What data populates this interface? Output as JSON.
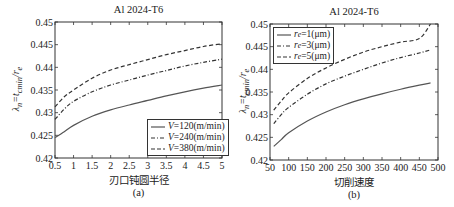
{
  "colors": {
    "axis": "#333333",
    "series_a": "#555555",
    "series_b": "#333333",
    "series_c": "#333333"
  },
  "chart_data": [
    {
      "type": "line",
      "panel": "a",
      "title": "Al 2024-T6",
      "xlabel": "刃口钝圆半径",
      "ylabel": "λn=tcmin/re",
      "caption": "(a)",
      "xlim": [
        0.5,
        5
      ],
      "ylim": [
        0.42,
        0.45
      ],
      "xticks": [
        "0.5",
        "1",
        "1.5",
        "2",
        "2.5",
        "3",
        "3.5",
        "4",
        "4.5",
        "5"
      ],
      "yticks": [
        "0.42",
        "0.425",
        "0.43",
        "0.435",
        "0.44",
        "0.445",
        "0.45"
      ],
      "legend_position": "lower right",
      "grid": false,
      "x": [
        0.5,
        0.75,
        1,
        1.5,
        2,
        2.5,
        3,
        3.5,
        4,
        4.5,
        5
      ],
      "series": [
        {
          "name": "V=120(m/min)",
          "style": "solid",
          "values": [
            0.4245,
            0.4258,
            0.4272,
            0.4292,
            0.4306,
            0.4317,
            0.4327,
            0.4337,
            0.4346,
            0.4354,
            0.4361
          ]
        },
        {
          "name": "V=240(m/min)",
          "style": "dashdot",
          "values": [
            0.4285,
            0.4308,
            0.4325,
            0.4346,
            0.4361,
            0.4372,
            0.4383,
            0.4393,
            0.4403,
            0.4411,
            0.4418
          ]
        },
        {
          "name": "V=380(m/min)",
          "style": "dashed",
          "values": [
            0.4313,
            0.4335,
            0.435,
            0.4376,
            0.4394,
            0.4406,
            0.4417,
            0.4428,
            0.4437,
            0.4446,
            0.4452
          ]
        }
      ]
    },
    {
      "type": "line",
      "panel": "b",
      "title": "Al 2024-T6",
      "xlabel": "切削速度",
      "ylabel": "λn=tcmin/re",
      "caption": "(b)",
      "xlim": [
        50,
        500
      ],
      "ylim": [
        0.42,
        0.45
      ],
      "xticks": [
        "50",
        "100",
        "150",
        "200",
        "250",
        "300",
        "350",
        "400",
        "450",
        "500"
      ],
      "yticks": [
        "0.42",
        "0.425",
        "0.43",
        "0.435",
        "0.44",
        "0.445",
        "0.45"
      ],
      "legend_position": "upper left",
      "grid": false,
      "x": [
        60,
        80,
        100,
        150,
        200,
        250,
        300,
        350,
        400,
        450,
        480
      ],
      "series": [
        {
          "name": "re=1(μm)",
          "style": "solid",
          "values": [
            0.423,
            0.4245,
            0.426,
            0.4286,
            0.4306,
            0.4322,
            0.4335,
            0.4346,
            0.4356,
            0.4365,
            0.437
          ]
        },
        {
          "name": "re=3(μm)",
          "style": "dashdot",
          "values": [
            0.428,
            0.43,
            0.4316,
            0.4345,
            0.4368,
            0.4385,
            0.44,
            0.4414,
            0.4426,
            0.4436,
            0.4443
          ]
        },
        {
          "name": "re=5(μm)",
          "style": "dashed",
          "values": [
            0.431,
            0.433,
            0.4348,
            0.438,
            0.4403,
            0.4422,
            0.4438,
            0.445,
            0.446,
            0.4468,
            0.45
          ]
        }
      ]
    }
  ],
  "panels": {
    "a": {
      "title": "Al 2024-T6",
      "xlabel": "刃口钝圆半径",
      "caption": "(a)",
      "legend": [
        {
          "prefix": "V",
          "suffix": "=120(m/min)"
        },
        {
          "prefix": "V",
          "suffix": "=240(m/min)"
        },
        {
          "prefix": "V",
          "suffix": "=380(m/min)"
        }
      ]
    },
    "b": {
      "title": "Al 2024-T6",
      "xlabel": "切削速度",
      "caption": "(b)",
      "legend": [
        {
          "prefix": "r",
          "sub": "e",
          "suffix": "=1(μm)"
        },
        {
          "prefix": "r",
          "sub": "e",
          "suffix": "=3(μm)"
        },
        {
          "prefix": "r",
          "sub": "e",
          "suffix": "=5(μm)"
        }
      ]
    }
  },
  "ylabel_parts": {
    "lambda": "λ",
    "lambda_sub": "n",
    "eq": "=",
    "t": "t",
    "t_sub": "cmin",
    "slash": "/",
    "r": "r",
    "r_sub": "e"
  }
}
